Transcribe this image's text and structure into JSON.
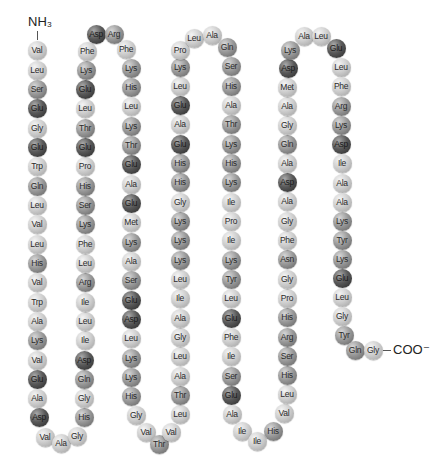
{
  "n_terminus": "NH₃",
  "c_terminus": "COO⁻",
  "colors": {
    "light": "#c8c8c8",
    "medium": "#8e8e8e",
    "dark": "#404040"
  },
  "shade_key": {
    "dark": [
      "Glu",
      "Asp"
    ],
    "medium": [
      "Lys",
      "Arg",
      "His",
      "Ser",
      "Thr",
      "Gln",
      "Asn",
      "Tyr"
    ],
    "light": [
      "Val",
      "Leu",
      "Gly",
      "Trp",
      "Ala",
      "Phe",
      "Pro",
      "Met",
      "Ile"
    ]
  },
  "residues": [
    {
      "aa": "Val",
      "x": 37,
      "y": 50
    },
    {
      "aa": "Leu",
      "x": 37,
      "y": 70
    },
    {
      "aa": "Ser",
      "x": 37,
      "y": 89
    },
    {
      "aa": "Glu",
      "x": 37,
      "y": 108
    },
    {
      "aa": "Gly",
      "x": 37,
      "y": 128
    },
    {
      "aa": "Glu",
      "x": 37,
      "y": 147
    },
    {
      "aa": "Trp",
      "x": 37,
      "y": 166
    },
    {
      "aa": "Gln",
      "x": 37,
      "y": 186
    },
    {
      "aa": "Leu",
      "x": 37,
      "y": 205
    },
    {
      "aa": "Val",
      "x": 37,
      "y": 224
    },
    {
      "aa": "Leu",
      "x": 37,
      "y": 244
    },
    {
      "aa": "His",
      "x": 37,
      "y": 263
    },
    {
      "aa": "Val",
      "x": 37,
      "y": 282
    },
    {
      "aa": "Trp",
      "x": 37,
      "y": 302
    },
    {
      "aa": "Ala",
      "x": 37,
      "y": 321
    },
    {
      "aa": "Lys",
      "x": 37,
      "y": 340
    },
    {
      "aa": "Val",
      "x": 37,
      "y": 360
    },
    {
      "aa": "Glu",
      "x": 37,
      "y": 379
    },
    {
      "aa": "Ala",
      "x": 37,
      "y": 398
    },
    {
      "aa": "Asp",
      "x": 39,
      "y": 417
    },
    {
      "aa": "Val",
      "x": 45,
      "y": 437
    },
    {
      "aa": "Ala",
      "x": 61,
      "y": 443
    },
    {
      "aa": "Gly",
      "x": 77,
      "y": 436
    },
    {
      "aa": "His",
      "x": 84,
      "y": 417
    },
    {
      "aa": "Gly",
      "x": 84,
      "y": 398
    },
    {
      "aa": "Gln",
      "x": 84,
      "y": 379
    },
    {
      "aa": "Asp",
      "x": 84,
      "y": 360
    },
    {
      "aa": "Ile",
      "x": 85,
      "y": 340
    },
    {
      "aa": "Leu",
      "x": 85,
      "y": 321
    },
    {
      "aa": "Ile",
      "x": 85,
      "y": 302
    },
    {
      "aa": "Arg",
      "x": 85,
      "y": 282
    },
    {
      "aa": "Leu",
      "x": 85,
      "y": 263
    },
    {
      "aa": "Phe",
      "x": 85,
      "y": 244
    },
    {
      "aa": "Lys",
      "x": 85,
      "y": 224
    },
    {
      "aa": "Ser",
      "x": 85,
      "y": 205
    },
    {
      "aa": "His",
      "x": 85,
      "y": 186
    },
    {
      "aa": "Pro",
      "x": 85,
      "y": 166
    },
    {
      "aa": "Glu",
      "x": 85,
      "y": 147
    },
    {
      "aa": "Thr",
      "x": 85,
      "y": 128
    },
    {
      "aa": "Leu",
      "x": 85,
      "y": 108
    },
    {
      "aa": "Glu",
      "x": 85,
      "y": 89
    },
    {
      "aa": "Lys",
      "x": 86,
      "y": 70
    },
    {
      "aa": "Phe",
      "x": 87,
      "y": 51
    },
    {
      "aa": "Asp",
      "x": 96,
      "y": 34
    },
    {
      "aa": "Arg",
      "x": 114,
      "y": 34
    },
    {
      "aa": "Phe",
      "x": 126,
      "y": 49
    },
    {
      "aa": "Lys",
      "x": 131,
      "y": 68
    },
    {
      "aa": "His",
      "x": 131,
      "y": 87
    },
    {
      "aa": "Leu",
      "x": 131,
      "y": 106
    },
    {
      "aa": "Lys",
      "x": 131,
      "y": 126
    },
    {
      "aa": "Thr",
      "x": 131,
      "y": 145
    },
    {
      "aa": "Glu",
      "x": 131,
      "y": 164
    },
    {
      "aa": "Ala",
      "x": 131,
      "y": 184
    },
    {
      "aa": "Glu",
      "x": 131,
      "y": 203
    },
    {
      "aa": "Met",
      "x": 131,
      "y": 222
    },
    {
      "aa": "Lys",
      "x": 131,
      "y": 242
    },
    {
      "aa": "Ala",
      "x": 131,
      "y": 261
    },
    {
      "aa": "Ser",
      "x": 131,
      "y": 280
    },
    {
      "aa": "Glu",
      "x": 131,
      "y": 300
    },
    {
      "aa": "Asp",
      "x": 131,
      "y": 319
    },
    {
      "aa": "Leu",
      "x": 131,
      "y": 338
    },
    {
      "aa": "Lys",
      "x": 131,
      "y": 358
    },
    {
      "aa": "Lys",
      "x": 131,
      "y": 377
    },
    {
      "aa": "His",
      "x": 131,
      "y": 396
    },
    {
      "aa": "Gly",
      "x": 136,
      "y": 415
    },
    {
      "aa": "Val",
      "x": 146,
      "y": 432
    },
    {
      "aa": "Thr",
      "x": 159,
      "y": 444
    },
    {
      "aa": "Val",
      "x": 171,
      "y": 432
    },
    {
      "aa": "Leu",
      "x": 180,
      "y": 414
    },
    {
      "aa": "Thr",
      "x": 180,
      "y": 395
    },
    {
      "aa": "Ala",
      "x": 180,
      "y": 376
    },
    {
      "aa": "Leu",
      "x": 180,
      "y": 356
    },
    {
      "aa": "Gly",
      "x": 180,
      "y": 337
    },
    {
      "aa": "Ala",
      "x": 180,
      "y": 318
    },
    {
      "aa": "Ile",
      "x": 180,
      "y": 298
    },
    {
      "aa": "Leu",
      "x": 180,
      "y": 279
    },
    {
      "aa": "Lys",
      "x": 180,
      "y": 260
    },
    {
      "aa": "Lys",
      "x": 180,
      "y": 240
    },
    {
      "aa": "Lys",
      "x": 180,
      "y": 221
    },
    {
      "aa": "Gly",
      "x": 180,
      "y": 202
    },
    {
      "aa": "His",
      "x": 180,
      "y": 182
    },
    {
      "aa": "His",
      "x": 180,
      "y": 163
    },
    {
      "aa": "Glu",
      "x": 180,
      "y": 144
    },
    {
      "aa": "Ala",
      "x": 180,
      "y": 124
    },
    {
      "aa": "Glu",
      "x": 180,
      "y": 105
    },
    {
      "aa": "Leu",
      "x": 180,
      "y": 86
    },
    {
      "aa": "Lys",
      "x": 180,
      "y": 67
    },
    {
      "aa": "Pro",
      "x": 180,
      "y": 50
    },
    {
      "aa": "Leu",
      "x": 194,
      "y": 38
    },
    {
      "aa": "Ala",
      "x": 212,
      "y": 35
    },
    {
      "aa": "Gln",
      "x": 227,
      "y": 47
    },
    {
      "aa": "Ser",
      "x": 231,
      "y": 66
    },
    {
      "aa": "His",
      "x": 231,
      "y": 86
    },
    {
      "aa": "Ala",
      "x": 231,
      "y": 105
    },
    {
      "aa": "Thr",
      "x": 231,
      "y": 124
    },
    {
      "aa": "Lys",
      "x": 231,
      "y": 144
    },
    {
      "aa": "His",
      "x": 231,
      "y": 163
    },
    {
      "aa": "Lys",
      "x": 231,
      "y": 182
    },
    {
      "aa": "Ile",
      "x": 231,
      "y": 202
    },
    {
      "aa": "Pro",
      "x": 231,
      "y": 221
    },
    {
      "aa": "Ile",
      "x": 231,
      "y": 240
    },
    {
      "aa": "Lys",
      "x": 231,
      "y": 260
    },
    {
      "aa": "Tyr",
      "x": 231,
      "y": 279
    },
    {
      "aa": "Leu",
      "x": 231,
      "y": 298
    },
    {
      "aa": "Glu",
      "x": 231,
      "y": 318
    },
    {
      "aa": "Phe",
      "x": 231,
      "y": 337
    },
    {
      "aa": "Ile",
      "x": 231,
      "y": 356
    },
    {
      "aa": "Ser",
      "x": 231,
      "y": 376
    },
    {
      "aa": "Glu",
      "x": 231,
      "y": 395
    },
    {
      "aa": "Ala",
      "x": 232,
      "y": 414
    },
    {
      "aa": "Ile",
      "x": 242,
      "y": 431
    },
    {
      "aa": "Ile",
      "x": 257,
      "y": 441
    },
    {
      "aa": "His",
      "x": 273,
      "y": 431
    },
    {
      "aa": "Val",
      "x": 284,
      "y": 413
    },
    {
      "aa": "Leu",
      "x": 287,
      "y": 394
    },
    {
      "aa": "His",
      "x": 287,
      "y": 375
    },
    {
      "aa": "Ser",
      "x": 287,
      "y": 356
    },
    {
      "aa": "Arg",
      "x": 287,
      "y": 337
    },
    {
      "aa": "His",
      "x": 287,
      "y": 317
    },
    {
      "aa": "Pro",
      "x": 287,
      "y": 298
    },
    {
      "aa": "Gly",
      "x": 287,
      "y": 279
    },
    {
      "aa": "Asn",
      "x": 287,
      "y": 259
    },
    {
      "aa": "Phe",
      "x": 287,
      "y": 240
    },
    {
      "aa": "Gly",
      "x": 287,
      "y": 221
    },
    {
      "aa": "Ala",
      "x": 287,
      "y": 201
    },
    {
      "aa": "Asp",
      "x": 287,
      "y": 182
    },
    {
      "aa": "Ala",
      "x": 287,
      "y": 163
    },
    {
      "aa": "Gln",
      "x": 287,
      "y": 144
    },
    {
      "aa": "Gly",
      "x": 287,
      "y": 125
    },
    {
      "aa": "Ala",
      "x": 287,
      "y": 106
    },
    {
      "aa": "Met",
      "x": 287,
      "y": 87
    },
    {
      "aa": "Asp",
      "x": 288,
      "y": 68
    },
    {
      "aa": "Lys",
      "x": 290,
      "y": 50
    },
    {
      "aa": "Ala",
      "x": 304,
      "y": 36
    },
    {
      "aa": "Leu",
      "x": 321,
      "y": 36
    },
    {
      "aa": "Glu",
      "x": 336,
      "y": 48
    },
    {
      "aa": "Leu",
      "x": 341,
      "y": 67
    },
    {
      "aa": "Phe",
      "x": 341,
      "y": 86
    },
    {
      "aa": "Arg",
      "x": 341,
      "y": 106
    },
    {
      "aa": "Lys",
      "x": 341,
      "y": 125
    },
    {
      "aa": "Asp",
      "x": 341,
      "y": 144
    },
    {
      "aa": "Ile",
      "x": 342,
      "y": 163
    },
    {
      "aa": "Ala",
      "x": 342,
      "y": 183
    },
    {
      "aa": "Ala",
      "x": 342,
      "y": 202
    },
    {
      "aa": "Lys",
      "x": 342,
      "y": 221
    },
    {
      "aa": "Tyr",
      "x": 342,
      "y": 240
    },
    {
      "aa": "Lys",
      "x": 342,
      "y": 259
    },
    {
      "aa": "Glu",
      "x": 342,
      "y": 278
    },
    {
      "aa": "Leu",
      "x": 342,
      "y": 297
    },
    {
      "aa": "Gly",
      "x": 342,
      "y": 316
    },
    {
      "aa": "Tyr",
      "x": 344,
      "y": 335
    },
    {
      "aa": "Gln",
      "x": 355,
      "y": 350
    },
    {
      "aa": "Gly",
      "x": 373,
      "y": 350
    }
  ]
}
